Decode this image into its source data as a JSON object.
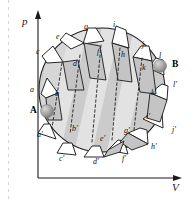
{
  "figure": {
    "axes": {
      "y_label": "p",
      "x_label": "V"
    },
    "markers": [
      {
        "id": "marker-a",
        "label": "A",
        "x": 36,
        "y": 110
      },
      {
        "id": "marker-b",
        "label": "B",
        "x": 168,
        "y": 64
      }
    ],
    "upper_points": [
      {
        "label": "a",
        "x": 30,
        "y": 86
      },
      {
        "label": "b",
        "x": 55,
        "y": 90
      },
      {
        "label": "c",
        "x": 36,
        "y": 48
      },
      {
        "label": "d",
        "x": 73,
        "y": 60
      },
      {
        "label": "e",
        "x": 56,
        "y": 33
      },
      {
        "label": "f",
        "x": 97,
        "y": 48
      },
      {
        "label": "g",
        "x": 84,
        "y": 23
      },
      {
        "label": "h",
        "x": 121,
        "y": 51
      },
      {
        "label": "i",
        "x": 113,
        "y": 21
      },
      {
        "label": "j",
        "x": 142,
        "y": 41
      },
      {
        "label": "k",
        "x": 142,
        "y": 64
      },
      {
        "label": "l",
        "x": 159,
        "y": 52
      }
    ],
    "lower_points": [
      {
        "label": "a'",
        "x": 37,
        "y": 131
      },
      {
        "label": "b'",
        "x": 72,
        "y": 125
      },
      {
        "label": "c'",
        "x": 59,
        "y": 155
      },
      {
        "label": "d'",
        "x": 93,
        "y": 158
      },
      {
        "label": "e'",
        "x": 100,
        "y": 135
      },
      {
        "label": "f'",
        "x": 122,
        "y": 155
      },
      {
        "label": "g'",
        "x": 124,
        "y": 127
      },
      {
        "label": "h'",
        "x": 151,
        "y": 143
      },
      {
        "label": "i'",
        "x": 146,
        "y": 113
      },
      {
        "label": "j'",
        "x": 172,
        "y": 126
      },
      {
        "label": "k'",
        "x": 151,
        "y": 89
      },
      {
        "label": "l'",
        "x": 173,
        "y": 81
      }
    ],
    "colors": {
      "surface_dark": "#cbcbcb",
      "surface_light": "#e2e2e2",
      "surface_mid": "#d6d6d6",
      "outline": "#1b1b1b",
      "dashed": "#2a2a2a",
      "sphere": "#9a9a9a",
      "axis": "#1a1a1a",
      "background": "#ffffff"
    }
  }
}
